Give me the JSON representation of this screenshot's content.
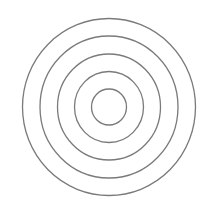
{
  "diagram": {
    "type": "concentric-circles",
    "center": {
      "x": 109,
      "y": 107
    },
    "stroke_color": "#7a7a7a",
    "stroke_width": 1.3,
    "background": "#ffffff",
    "rings": [
      {
        "rx": 86.5,
        "ry": 88.5
      },
      {
        "rx": 69,
        "ry": 71
      },
      {
        "rx": 51.5,
        "ry": 53
      },
      {
        "rx": 34.5,
        "ry": 35.5
      },
      {
        "rx": 17.5,
        "ry": 18
      }
    ]
  }
}
